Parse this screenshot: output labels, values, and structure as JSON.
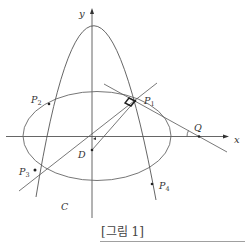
{
  "figure": {
    "caption": "[그림 1]",
    "colors": {
      "line": "#555555",
      "text": "#333333",
      "background": "#ffffff",
      "rule": "#888888"
    },
    "axes": {
      "x_label": "x",
      "y_label": "y"
    },
    "curves": {
      "parabola": {
        "name": "parabola",
        "vertex": "on y-axis above ellipse"
      },
      "ellipse": {
        "label": "C"
      }
    },
    "points": {
      "P1": {
        "base": "P",
        "sub": "1"
      },
      "P2": {
        "base": "P",
        "sub": "2"
      },
      "P3": {
        "base": "P",
        "sub": "3"
      },
      "P4": {
        "base": "P",
        "sub": "4"
      },
      "Q": {
        "base": "Q"
      },
      "D": {
        "base": "D"
      }
    },
    "annotations": {
      "right_angle_at": "P1",
      "angle_mark_at": "Q"
    }
  }
}
